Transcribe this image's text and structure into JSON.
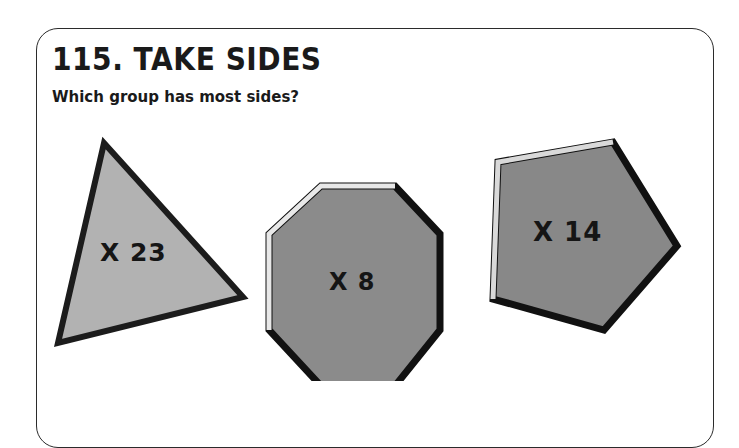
{
  "card": {
    "title": "115. TAKE SIDES",
    "subtitle": "Which group has most sides?"
  },
  "shapes": [
    {
      "name": "triangle",
      "sides": 3,
      "label": "X 23",
      "fill": "#b2b2b2",
      "outline": "#1c1c1c"
    },
    {
      "name": "octagon",
      "sides": 8,
      "label": "X 8",
      "fill": "#8b8b8b",
      "outline": "#111111"
    },
    {
      "name": "pentagon",
      "sides": 5,
      "label": "X 14",
      "fill": "#888888",
      "outline": "#111111"
    }
  ],
  "colors": {
    "page_background": "#ffffff",
    "card_border": "#2b2b2b",
    "text": "#1a1a1a"
  }
}
